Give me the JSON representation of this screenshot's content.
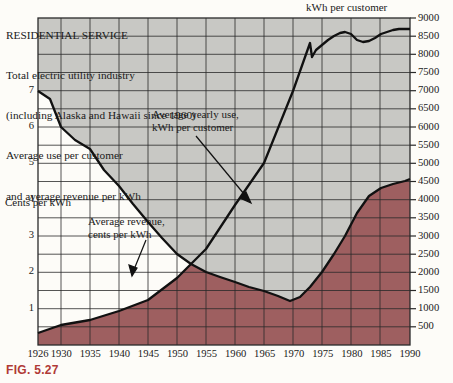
{
  "header": {
    "title": "RESIDENTIAL SERVICE",
    "line2": "Total electric utility industry",
    "line3": "(including Alaska and Hawaii since 1960)",
    "line4": "Average use per customer",
    "line5": "and average revenue per kWh"
  },
  "figure_number": "FIG. 5.27",
  "labels": {
    "top_axis_title": "kWh per customer",
    "left_axis_title": "Cents per kWh",
    "annotation_use": "Average yearly use,\nkWh per customer",
    "annotation_revenue": "Average revenue,\ncents per kWh"
  },
  "colors": {
    "area_kwh": "#9e5f60",
    "area_revenue": "#c8c8c4",
    "line": "#111111",
    "grid": "#2a2a2a",
    "figno": "#b03a36",
    "background": "#fdfcf8"
  },
  "chart_data": {
    "type": "area",
    "xlabel": "",
    "xlim": [
      1926,
      1990
    ],
    "grid": true,
    "legend": "annotations",
    "x_ticks": [
      1926,
      1930,
      1935,
      1940,
      1945,
      1950,
      1955,
      1960,
      1965,
      1970,
      1975,
      1980,
      1985,
      1990
    ],
    "y_left": {
      "label": "Cents per kWh",
      "ticks": [
        1,
        2,
        3,
        4,
        5,
        6,
        7
      ],
      "lim": [
        0,
        9
      ]
    },
    "y_right": {
      "label": "kWh per customer",
      "ticks": [
        500,
        1000,
        1500,
        2000,
        2500,
        3000,
        3500,
        4000,
        4500,
        5000,
        5500,
        6000,
        6500,
        7000,
        7500,
        8000,
        8500,
        9000
      ],
      "lim": [
        0,
        9000
      ]
    },
    "series": [
      {
        "name": "Average yearly use, kWh per customer",
        "axis": "right",
        "units": "kWh",
        "x": [
          1926,
          1930,
          1935,
          1940,
          1945,
          1950,
          1955,
          1960,
          1965,
          1970,
          1973,
          1975,
          1977,
          1979,
          1980,
          1982,
          1984,
          1986,
          1988,
          1990
        ],
        "values": [
          330,
          550,
          700,
          950,
          1250,
          1850,
          2650,
          3850,
          5000,
          7000,
          8300,
          8200,
          8600,
          8700,
          8600,
          8400,
          8550,
          8700,
          8800,
          8800
        ]
      },
      {
        "name": "Average revenue, cents per kWh",
        "axis": "left",
        "units": "cents",
        "x": [
          1926,
          1930,
          1935,
          1940,
          1945,
          1950,
          1955,
          1960,
          1965,
          1970,
          1973,
          1975,
          1978,
          1980,
          1982,
          1985,
          1988,
          1990
        ],
        "values": [
          7.0,
          6.0,
          5.4,
          4.3,
          3.5,
          3.0,
          2.7,
          2.5,
          2.3,
          2.1,
          2.4,
          3.2,
          4.0,
          5.0,
          6.3,
          7.4,
          7.6,
          7.8
        ]
      }
    ]
  }
}
